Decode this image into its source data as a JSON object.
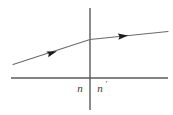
{
  "figure": {
    "kind": "optics-refraction-diagram",
    "width": 173,
    "height": 115,
    "background_color": "#ffffff",
    "line_color": "#5a5a5a",
    "ray_color": "#6a6a6a",
    "arrow_color": "#1a1a1a",
    "label_color": "#3a3a3a"
  },
  "labels": {
    "index_left": "n",
    "index_right": "n",
    "index_right_prime": "′",
    "index_right_full": "n′"
  },
  "geometry": {
    "optical_axis": {
      "name": "horizontal-axis",
      "x1": 11,
      "y1": 78,
      "x2": 168,
      "y2": 78
    },
    "interface": {
      "name": "vertical-interface",
      "x1": 90,
      "y1": 8,
      "x2": 90,
      "y2": 110
    },
    "incident_ray": {
      "name": "incident-ray",
      "x1": 13,
      "y1": 64.5,
      "x2": 90,
      "y2": 39.5
    },
    "refracted_ray": {
      "name": "refracted-ray",
      "x1": 90,
      "y1": 39.5,
      "x2": 168,
      "y2": 31.5
    },
    "incident_arrow": {
      "name": "incident-arrow",
      "cx": 52,
      "cy": 52.8,
      "angle_deg": -17.9
    },
    "refracted_arrow": {
      "name": "refracted-arrow",
      "cx": 123,
      "cy": 36.1,
      "angle_deg": -5.9
    },
    "label_n_position": {
      "x": 80,
      "y": 92
    },
    "label_nprime_position": {
      "x": 101,
      "y": 92
    }
  }
}
